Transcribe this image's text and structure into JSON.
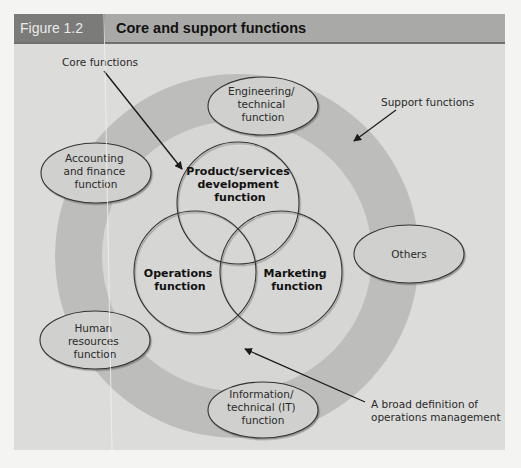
{
  "figure": {
    "number": "Figure 1.2",
    "title": "Core and support functions"
  },
  "colors": {
    "page_background": "#f4f4f2",
    "panel_background": "#dcdcda",
    "header_bar": "#a9a9a7",
    "header_tab": "#7b7b79",
    "support_ring": "#bdbdbb",
    "inner_area": "#d6d6d4",
    "ellipse_fill": "#d0d0ce",
    "outline": "#333333"
  },
  "annotations": {
    "core_functions": "Core functions",
    "support_functions": "Support functions",
    "broad_definition": [
      "A broad definition of",
      "operations management"
    ]
  },
  "core_functions": [
    {
      "id": "product",
      "lines": [
        "Product/services",
        "development",
        "function"
      ]
    },
    {
      "id": "operations",
      "lines": [
        "Operations",
        "function"
      ]
    },
    {
      "id": "marketing",
      "lines": [
        "Marketing",
        "function"
      ]
    }
  ],
  "support_functions": [
    {
      "id": "engineering",
      "lines": [
        "Engineering/",
        "technical",
        "function"
      ]
    },
    {
      "id": "accounting",
      "lines": [
        "Accounting",
        "and finance",
        "function"
      ]
    },
    {
      "id": "others",
      "lines": [
        "Others"
      ]
    },
    {
      "id": "human-resources",
      "lines": [
        "Human",
        "resources",
        "function"
      ]
    },
    {
      "id": "information-technology",
      "lines": [
        "Information/",
        "technical (IT)",
        "function"
      ]
    }
  ]
}
